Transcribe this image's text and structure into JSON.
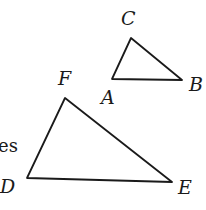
{
  "text_fragment": "es",
  "triangles": [
    {
      "name": "ABC",
      "vertices": [
        {
          "label": "A",
          "x": 112,
          "y": 79,
          "lx": 101,
          "ly": 104
        },
        {
          "label": "B",
          "x": 182,
          "y": 80,
          "lx": 189,
          "ly": 91
        },
        {
          "label": "C",
          "x": 131,
          "y": 38,
          "lx": 121,
          "ly": 25
        }
      ]
    },
    {
      "name": "DEF",
      "vertices": [
        {
          "label": "D",
          "x": 27,
          "y": 178,
          "lx": 0,
          "ly": 193
        },
        {
          "label": "E",
          "x": 172,
          "y": 182,
          "lx": 178,
          "ly": 194
        },
        {
          "label": "F",
          "x": 65,
          "y": 98,
          "lx": 58,
          "ly": 85
        }
      ]
    }
  ],
  "colors": {
    "ink": "#1a1a1a",
    "background": "#ffffff"
  }
}
